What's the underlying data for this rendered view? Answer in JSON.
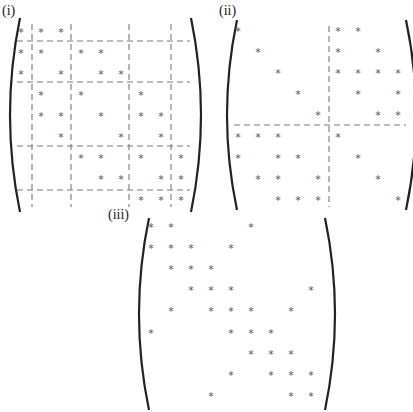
{
  "figure": {
    "entry_symbol": "*",
    "colors": {
      "entry": "#555555",
      "dashed_line": "#7a7a7a",
      "bracket": "#222222",
      "label": "#222222"
    }
  },
  "matrices": [
    {
      "id": "i",
      "label": "(i)",
      "size": [
        9,
        9
      ],
      "label_pos": [
        2,
        16
      ],
      "origin": [
        21,
        31
      ],
      "cell": [
        20,
        21
      ],
      "bracket": {
        "left_x": 14,
        "right_x": 197,
        "top": 18,
        "bottom": 212
      },
      "partition": {
        "row_splits_after": [
          1,
          3,
          6,
          8
        ],
        "col_splits_after": [
          1,
          3,
          6,
          8
        ],
        "vlines_x": [
          32,
          71,
          129,
          171
        ],
        "hlines_y": [
          41,
          82,
          146,
          190
        ],
        "extent": {
          "x0": 17,
          "x1": 190,
          "y0": 24,
          "y1": 207
        }
      },
      "nonzeros": [
        [
          1,
          1
        ],
        [
          1,
          2
        ],
        [
          1,
          3
        ],
        [
          2,
          1
        ],
        [
          2,
          2
        ],
        [
          2,
          4
        ],
        [
          2,
          5
        ],
        [
          3,
          1
        ],
        [
          3,
          3
        ],
        [
          3,
          5
        ],
        [
          3,
          6
        ],
        [
          4,
          2
        ],
        [
          4,
          4
        ],
        [
          4,
          7
        ],
        [
          5,
          2
        ],
        [
          5,
          3
        ],
        [
          5,
          5
        ],
        [
          5,
          7
        ],
        [
          5,
          8
        ],
        [
          6,
          3
        ],
        [
          6,
          6
        ],
        [
          6,
          8
        ],
        [
          7,
          4
        ],
        [
          7,
          5
        ],
        [
          7,
          7
        ],
        [
          7,
          9
        ],
        [
          8,
          5
        ],
        [
          8,
          6
        ],
        [
          8,
          8
        ],
        [
          8,
          9
        ],
        [
          9,
          7
        ],
        [
          9,
          8
        ],
        [
          9,
          9
        ]
      ]
    },
    {
      "id": "ii",
      "label": "(ii)",
      "size": [
        9,
        9
      ],
      "label_pos": [
        219,
        16
      ],
      "origin": [
        238,
        30
      ],
      "cell": [
        20,
        21.1
      ],
      "bracket": {
        "left_x": 231,
        "right_x": 412,
        "top": 20,
        "bottom": 210
      },
      "partition": {
        "row_splits_after": [
          5
        ],
        "col_splits_after": [
          5
        ],
        "vlines_x": [
          329
        ],
        "hlines_y": [
          125
        ],
        "extent": {
          "x0": 234,
          "x1": 406,
          "y0": 26,
          "y1": 207
        }
      },
      "nonzeros": [
        [
          1,
          1
        ],
        [
          1,
          6
        ],
        [
          1,
          7
        ],
        [
          2,
          2
        ],
        [
          2,
          6
        ],
        [
          2,
          8
        ],
        [
          3,
          3
        ],
        [
          3,
          6
        ],
        [
          3,
          7
        ],
        [
          3,
          8
        ],
        [
          3,
          9
        ],
        [
          4,
          4
        ],
        [
          4,
          7
        ],
        [
          4,
          9
        ],
        [
          5,
          5
        ],
        [
          5,
          8
        ],
        [
          5,
          9
        ],
        [
          6,
          1
        ],
        [
          6,
          2
        ],
        [
          6,
          3
        ],
        [
          6,
          6
        ],
        [
          7,
          1
        ],
        [
          7,
          3
        ],
        [
          7,
          4
        ],
        [
          7,
          7
        ],
        [
          8,
          2
        ],
        [
          8,
          3
        ],
        [
          8,
          5
        ],
        [
          8,
          8
        ],
        [
          9,
          3
        ],
        [
          9,
          4
        ],
        [
          9,
          5
        ],
        [
          9,
          9
        ]
      ]
    },
    {
      "id": "iii",
      "label": "(iii)",
      "size": [
        9,
        9
      ],
      "label_pos": [
        108,
        220
      ],
      "origin": [
        151,
        226
      ],
      "cell": [
        20,
        21.1
      ],
      "bracket": {
        "left_x": 143,
        "right_x": 331,
        "top": 218,
        "bottom": 410
      },
      "partition": null,
      "nonzeros": [
        [
          1,
          1
        ],
        [
          1,
          2
        ],
        [
          1,
          6
        ],
        [
          2,
          1
        ],
        [
          2,
          2
        ],
        [
          2,
          3
        ],
        [
          2,
          5
        ],
        [
          3,
          2
        ],
        [
          3,
          3
        ],
        [
          3,
          4
        ],
        [
          4,
          3
        ],
        [
          4,
          4
        ],
        [
          4,
          5
        ],
        [
          4,
          9
        ],
        [
          5,
          2
        ],
        [
          5,
          4
        ],
        [
          5,
          5
        ],
        [
          5,
          6
        ],
        [
          5,
          8
        ],
        [
          6,
          1
        ],
        [
          6,
          5
        ],
        [
          6,
          6
        ],
        [
          6,
          7
        ],
        [
          7,
          6
        ],
        [
          7,
          7
        ],
        [
          7,
          8
        ],
        [
          8,
          5
        ],
        [
          8,
          7
        ],
        [
          8,
          8
        ],
        [
          8,
          9
        ],
        [
          9,
          4
        ],
        [
          9,
          8
        ],
        [
          9,
          9
        ]
      ]
    }
  ]
}
